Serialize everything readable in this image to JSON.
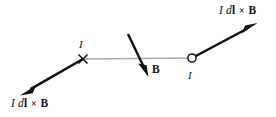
{
  "figure": {
    "background_color": "#ffffff",
    "wire_color": "#a8a8a8",
    "arrow_color": "#111111",
    "marker_color": "#111111",
    "width": 276,
    "height": 117
  },
  "labels": {
    "force_top_right": {
      "current_symbol": "I",
      "differential": "d",
      "length_vector": "l",
      "cross": "×",
      "field_symbol": "B"
    },
    "force_bottom_left": {
      "current_symbol": "I",
      "differential": "d",
      "length_vector": "l",
      "cross": "×",
      "field_symbol": "B"
    },
    "current_left": "I",
    "current_right": "I",
    "field": "B"
  },
  "markers": {
    "cross_marker": {
      "name": "x-marker",
      "x": 83,
      "y": 59
    },
    "circle_marker": {
      "name": "open-circle-marker",
      "x": 192,
      "y": 58
    }
  },
  "vectors": {
    "wire": {
      "x1": 83,
      "y1": 59,
      "x2": 192,
      "y2": 58
    },
    "force_left": {
      "x1": 83,
      "y1": 59,
      "x2": 22,
      "y2": 94
    },
    "force_right": {
      "x1": 192,
      "y1": 58,
      "x2": 256,
      "y2": 24
    },
    "field_b": {
      "x1": 128,
      "y1": 34,
      "x2": 148,
      "y2": 76
    }
  }
}
